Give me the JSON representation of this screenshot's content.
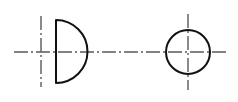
{
  "canvas": {
    "width": 238,
    "height": 102,
    "background": "#ffffff",
    "title": "Orthographic projection: semicircular profile and circular end view"
  },
  "style": {
    "object_line_color": "#111111",
    "object_line_width": 2.0,
    "center_line_color": "#5a5a5a",
    "center_line_width": 1.4,
    "center_line_dash": "14,3,2,3"
  },
  "chart_data": {
    "type": "diagram",
    "title": "Orthographic projection: semicircular profile and circular end view",
    "xlabel": "",
    "ylabel": "",
    "xlim": [
      0,
      238
    ],
    "ylim": [
      0,
      102
    ],
    "grid": false,
    "legend": null,
    "views": [
      {
        "name": "left-view-semicircle",
        "shape": "semicircle",
        "description": "D shape: vertical flat chord on the left, arc bulging to the right",
        "chord_x": 56,
        "top_y": 20,
        "bottom_y": 83,
        "arc_apex_x": 88,
        "center": [
          56,
          51.5
        ],
        "radius": 31.5
      },
      {
        "name": "right-view-circle",
        "shape": "circle",
        "description": "Full circle end view",
        "center": [
          188,
          52
        ],
        "radius": 22,
        "left_x": 166,
        "right_x": 210,
        "top_y": 30,
        "bottom_y": 74
      }
    ],
    "center_lines": [
      {
        "name": "horizontal-axis-centerline",
        "orientation": "horizontal",
        "y": 52,
        "x_start": 14,
        "x_end": 228,
        "style": "dash-dot"
      },
      {
        "name": "left-view-vertical-centerline",
        "orientation": "vertical",
        "x": 41,
        "y_start": 16,
        "y_end": 87,
        "style": "dash-dot"
      },
      {
        "name": "right-view-vertical-centerline",
        "orientation": "vertical",
        "x": 188,
        "y_start": 14,
        "y_end": 90,
        "style": "dash-dot"
      }
    ],
    "annotations": []
  }
}
